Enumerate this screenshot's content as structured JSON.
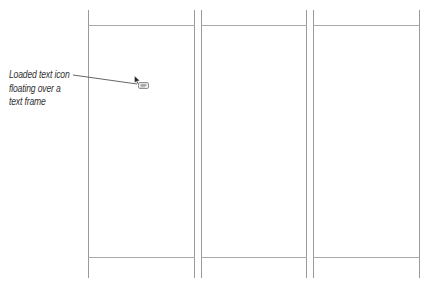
{
  "callout": {
    "lines": [
      "Loaded text icon",
      "floating over a",
      "text frame"
    ]
  },
  "icon": {
    "name": "loaded-text-icon",
    "glyph_text": "≡"
  },
  "layout": {
    "columns": 3,
    "guide_color": "#9a9a9a",
    "leader_color": "#555555"
  }
}
